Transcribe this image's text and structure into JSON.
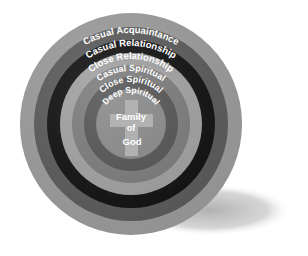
{
  "diagram": {
    "type": "concentric-circles",
    "center": {
      "label_lines": [
        "Family",
        "of",
        "God"
      ],
      "symbol": "cross-icon",
      "fill": "#8a8a8a",
      "cross_fill": "#b8b8b8"
    },
    "rings": [
      {
        "label": "Casual Acquaintance",
        "fill": "#9e9e9e"
      },
      {
        "label": "Casual Relationship",
        "fill": "#5c5c5c"
      },
      {
        "label": "Close Relationship",
        "fill": "#111111"
      },
      {
        "label": "Casual Spiritual",
        "fill": "#a2a2a2"
      },
      {
        "label": "Close Spiritual",
        "fill": "#7c7c7c"
      },
      {
        "label": "Deep Spiritual",
        "fill": "#555555"
      }
    ],
    "shadow_color": "#bdbdbd"
  }
}
